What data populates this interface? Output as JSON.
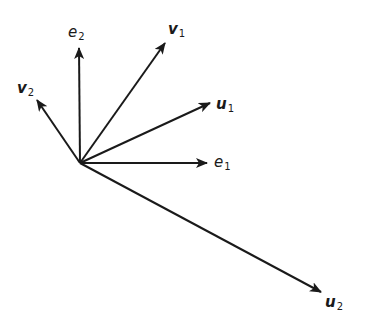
{
  "diagram": {
    "title": "",
    "origin": [
      80,
      163
    ],
    "stroke_color": "#1a1a1a",
    "vectors": [
      {
        "id": "e1",
        "label_main": "e",
        "label_sub": "1",
        "style": "italic",
        "tip": [
          207,
          163
        ],
        "label_pos": [
          214,
          154
        ]
      },
      {
        "id": "e2",
        "label_main": "e",
        "label_sub": "2",
        "style": "italic",
        "tip": [
          79,
          48
        ],
        "label_pos": [
          68,
          24
        ]
      },
      {
        "id": "v1",
        "label_main": "v",
        "label_sub": "1",
        "style": "bold-italic",
        "tip": [
          165,
          43
        ],
        "label_pos": [
          168,
          21
        ]
      },
      {
        "id": "v2",
        "label_main": "v",
        "label_sub": "2",
        "style": "bold-italic",
        "tip": [
          37,
          100
        ],
        "label_pos": [
          17,
          80
        ]
      },
      {
        "id": "u1",
        "label_main": "u",
        "label_sub": "1",
        "style": "bold-italic",
        "tip": [
          210,
          103
        ],
        "label_pos": [
          216,
          96
        ]
      },
      {
        "id": "u2",
        "label_main": "u",
        "label_sub": "2",
        "style": "bold-italic",
        "tip": [
          321,
          292
        ],
        "label_pos": [
          325,
          294
        ]
      }
    ]
  }
}
